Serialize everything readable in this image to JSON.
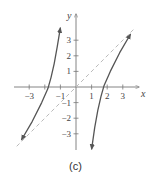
{
  "chart_data": {
    "type": "line",
    "title": "",
    "caption": "(c)",
    "xlabel": "x",
    "ylabel": "y",
    "xlim": [
      -3.5,
      3.5
    ],
    "ylim": [
      -3.5,
      3.5
    ],
    "xticks": [
      -3,
      -1,
      1,
      2,
      3
    ],
    "yticks": [
      -3,
      -2,
      -1,
      1,
      2,
      3
    ],
    "grid": false,
    "series": [
      {
        "name": "left branch",
        "style": "solid-arrow",
        "color": "#555555",
        "points": [
          [
            -3.5,
            -3.4
          ],
          [
            -2.8,
            -2.2
          ],
          [
            -2.2,
            -1.0
          ],
          [
            -1.8,
            -0.1
          ],
          [
            -1.6,
            0.6
          ],
          [
            -1.4,
            1.5
          ],
          [
            -1.2,
            2.6
          ],
          [
            -1.0,
            3.8
          ]
        ]
      },
      {
        "name": "right branch",
        "style": "solid-arrow",
        "color": "#555555",
        "points": [
          [
            1.0,
            -4.0
          ],
          [
            1.2,
            -2.6
          ],
          [
            1.4,
            -1.5
          ],
          [
            1.6,
            -0.6
          ],
          [
            1.8,
            0.1
          ],
          [
            2.2,
            1.0
          ],
          [
            2.8,
            2.2
          ],
          [
            3.5,
            3.4
          ]
        ]
      },
      {
        "name": "y = x asymptote",
        "style": "dashed",
        "color": "#bbbbbb",
        "points": [
          [
            -3.8,
            -3.8
          ],
          [
            3.8,
            3.8
          ]
        ]
      }
    ]
  },
  "labels": {
    "caption": "(c)"
  }
}
